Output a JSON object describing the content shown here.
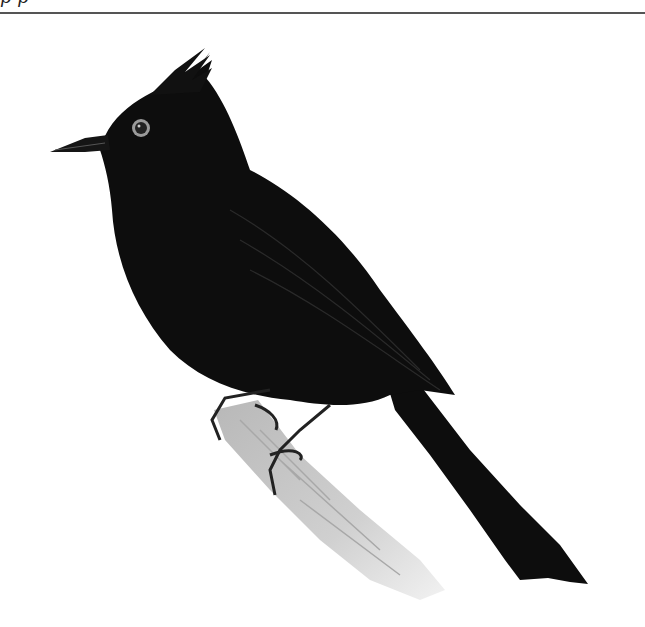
{
  "page": {
    "header_text_cropped": "p p",
    "rule_color": "#555555"
  },
  "illustration": {
    "subject": "black crested bird perched on a branch",
    "icon": "bird-illustration",
    "colors": {
      "plumage": "#0d0d0d",
      "eye_ring": "#9a9a9a",
      "branch": "#c8c8c8",
      "background": "#ffffff"
    }
  }
}
